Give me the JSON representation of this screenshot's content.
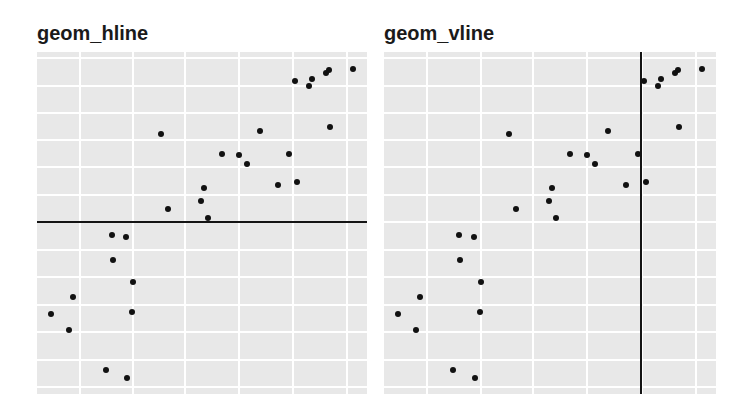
{
  "chart_data": [
    {
      "type": "scatter",
      "title": "geom_hline",
      "xlabel": "",
      "ylabel": "",
      "grid": true,
      "axes_visible": false,
      "reference_line": {
        "orientation": "horizontal",
        "position": 0.503,
        "color": "#141414"
      },
      "note": "coordinates normalized to panel (0-1, y upward); no axis tick labels shown",
      "points": [
        [
          0.042,
          0.234
        ],
        [
          0.109,
          0.284
        ],
        [
          0.097,
          0.187
        ],
        [
          0.209,
          0.07
        ],
        [
          0.273,
          0.047
        ],
        [
          0.227,
          0.465
        ],
        [
          0.27,
          0.459
        ],
        [
          0.23,
          0.392
        ],
        [
          0.291,
          0.327
        ],
        [
          0.288,
          0.24
        ],
        [
          0.376,
          0.76
        ],
        [
          0.397,
          0.541
        ],
        [
          0.497,
          0.564
        ],
        [
          0.506,
          0.602
        ],
        [
          0.518,
          0.515
        ],
        [
          0.561,
          0.702
        ],
        [
          0.612,
          0.699
        ],
        [
          0.636,
          0.673
        ],
        [
          0.676,
          0.769
        ],
        [
          0.73,
          0.611
        ],
        [
          0.764,
          0.702
        ],
        [
          0.788,
          0.62
        ],
        [
          0.782,
          0.915
        ],
        [
          0.824,
          0.901
        ],
        [
          0.833,
          0.921
        ],
        [
          0.876,
          0.939
        ],
        [
          0.885,
          0.947
        ],
        [
          0.888,
          0.781
        ],
        [
          0.958,
          0.95
        ]
      ]
    },
    {
      "type": "scatter",
      "title": "geom_vline",
      "xlabel": "",
      "ylabel": "",
      "grid": true,
      "axes_visible": false,
      "reference_line": {
        "orientation": "vertical",
        "position": 0.774,
        "color": "#141414"
      },
      "note": "same data as left panel",
      "points": [
        [
          0.042,
          0.234
        ],
        [
          0.109,
          0.284
        ],
        [
          0.097,
          0.187
        ],
        [
          0.209,
          0.07
        ],
        [
          0.273,
          0.047
        ],
        [
          0.227,
          0.465
        ],
        [
          0.27,
          0.459
        ],
        [
          0.23,
          0.392
        ],
        [
          0.291,
          0.327
        ],
        [
          0.288,
          0.24
        ],
        [
          0.376,
          0.76
        ],
        [
          0.397,
          0.541
        ],
        [
          0.497,
          0.564
        ],
        [
          0.506,
          0.602
        ],
        [
          0.518,
          0.515
        ],
        [
          0.561,
          0.702
        ],
        [
          0.612,
          0.699
        ],
        [
          0.636,
          0.673
        ],
        [
          0.676,
          0.769
        ],
        [
          0.73,
          0.611
        ],
        [
          0.764,
          0.702
        ],
        [
          0.788,
          0.62
        ],
        [
          0.782,
          0.915
        ],
        [
          0.824,
          0.901
        ],
        [
          0.833,
          0.921
        ],
        [
          0.876,
          0.939
        ],
        [
          0.885,
          0.947
        ],
        [
          0.888,
          0.781
        ],
        [
          0.958,
          0.95
        ]
      ]
    }
  ],
  "grid": {
    "x": [
      0.13,
      0.291,
      0.448,
      0.612,
      0.776,
      0.939
    ],
    "y": [
      0.02,
      0.099,
      0.181,
      0.26,
      0.342,
      0.421,
      0.503,
      0.582,
      0.664,
      0.743,
      0.822,
      0.901,
      0.982
    ]
  },
  "colors": {
    "panel_bg": "#e8e8e8",
    "grid": "#ffffff",
    "point": "#111111",
    "reference_line": "#141414"
  },
  "panels": [
    {
      "title": "geom_hline"
    },
    {
      "title": "geom_vline"
    }
  ]
}
